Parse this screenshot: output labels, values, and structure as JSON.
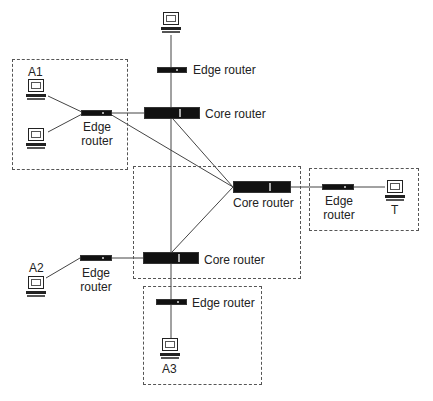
{
  "diagram": {
    "type": "network-topology",
    "groups": [
      {
        "id": "group-a1",
        "label": "A1"
      },
      {
        "id": "group-core",
        "label": ""
      },
      {
        "id": "group-t",
        "label": "T"
      },
      {
        "id": "group-a3",
        "label": "A3"
      }
    ],
    "labels": {
      "a1": "A1",
      "a2": "A2",
      "a3": "A3",
      "t": "T",
      "edge_router": "Edge router",
      "edge_line1": "Edge",
      "edge_line2": "router",
      "core_router": "Core router"
    },
    "nodes": [
      {
        "id": "pc-top",
        "type": "host"
      },
      {
        "id": "edge-top",
        "type": "edge-router",
        "label": "Edge router"
      },
      {
        "id": "core-top",
        "type": "core-router",
        "label": "Core router"
      },
      {
        "id": "pc-a1-1",
        "type": "host",
        "group": "A1"
      },
      {
        "id": "pc-a1-2",
        "type": "host",
        "group": "A1"
      },
      {
        "id": "edge-a1",
        "type": "edge-router",
        "label": "Edge router"
      },
      {
        "id": "core-right",
        "type": "core-router",
        "label": "Core router"
      },
      {
        "id": "edge-t",
        "type": "edge-router",
        "label": "Edge router"
      },
      {
        "id": "pc-t",
        "type": "host",
        "label": "T"
      },
      {
        "id": "core-bottom",
        "type": "core-router",
        "label": "Core router"
      },
      {
        "id": "edge-a2",
        "type": "edge-router",
        "label": "Edge router"
      },
      {
        "id": "pc-a2",
        "type": "host",
        "label": "A2"
      },
      {
        "id": "edge-a3",
        "type": "edge-router",
        "label": "Edge router"
      },
      {
        "id": "pc-a3",
        "type": "host",
        "label": "A3"
      }
    ],
    "edges": [
      [
        "pc-top",
        "edge-top"
      ],
      [
        "edge-top",
        "core-top"
      ],
      [
        "pc-a1-1",
        "edge-a1"
      ],
      [
        "pc-a1-2",
        "edge-a1"
      ],
      [
        "edge-a1",
        "core-top"
      ],
      [
        "edge-a1",
        "core-right"
      ],
      [
        "core-top",
        "core-right"
      ],
      [
        "core-top",
        "core-bottom"
      ],
      [
        "core-bottom",
        "core-right"
      ],
      [
        "core-right",
        "edge-t"
      ],
      [
        "edge-t",
        "pc-t"
      ],
      [
        "edge-a2",
        "core-bottom"
      ],
      [
        "pc-a2",
        "edge-a2"
      ],
      [
        "core-bottom",
        "edge-a3"
      ],
      [
        "edge-a3",
        "pc-a3"
      ]
    ]
  }
}
